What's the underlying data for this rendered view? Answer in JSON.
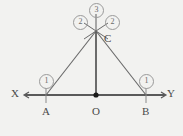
{
  "figure": {
    "background_color": "#f2f2f0",
    "line_color": "#5a5a5a",
    "label_color": "#4a4a4a",
    "badge_color": "#6a6a6a"
  },
  "points": [
    {
      "name": "X",
      "label": "X",
      "x": 18,
      "y": 95
    },
    {
      "name": "A",
      "label": "A",
      "x": 46,
      "y": 95
    },
    {
      "name": "O",
      "label": "O",
      "x": 96,
      "y": 95
    },
    {
      "name": "B",
      "label": "B",
      "x": 146,
      "y": 95
    },
    {
      "name": "Y",
      "label": "Y",
      "x": 170,
      "y": 95
    },
    {
      "name": "C",
      "label": "C",
      "x": 96,
      "y": 31
    }
  ],
  "labels": {
    "x_end": "X",
    "y_end": "Y",
    "a_point": "A",
    "b_point": "B",
    "o_point": "O",
    "c_point": "C"
  },
  "step_badges": [
    {
      "name": "step-1-left",
      "text": "1",
      "x": 39,
      "y": 74
    },
    {
      "name": "step-1-right",
      "text": "1",
      "x": 139,
      "y": 74
    },
    {
      "name": "step-2-left",
      "text": "2",
      "x": 73,
      "y": 15
    },
    {
      "name": "step-2-right",
      "text": "2",
      "x": 105,
      "y": 15
    },
    {
      "name": "step-3-top",
      "text": "3",
      "x": 89,
      "y": 3
    }
  ]
}
